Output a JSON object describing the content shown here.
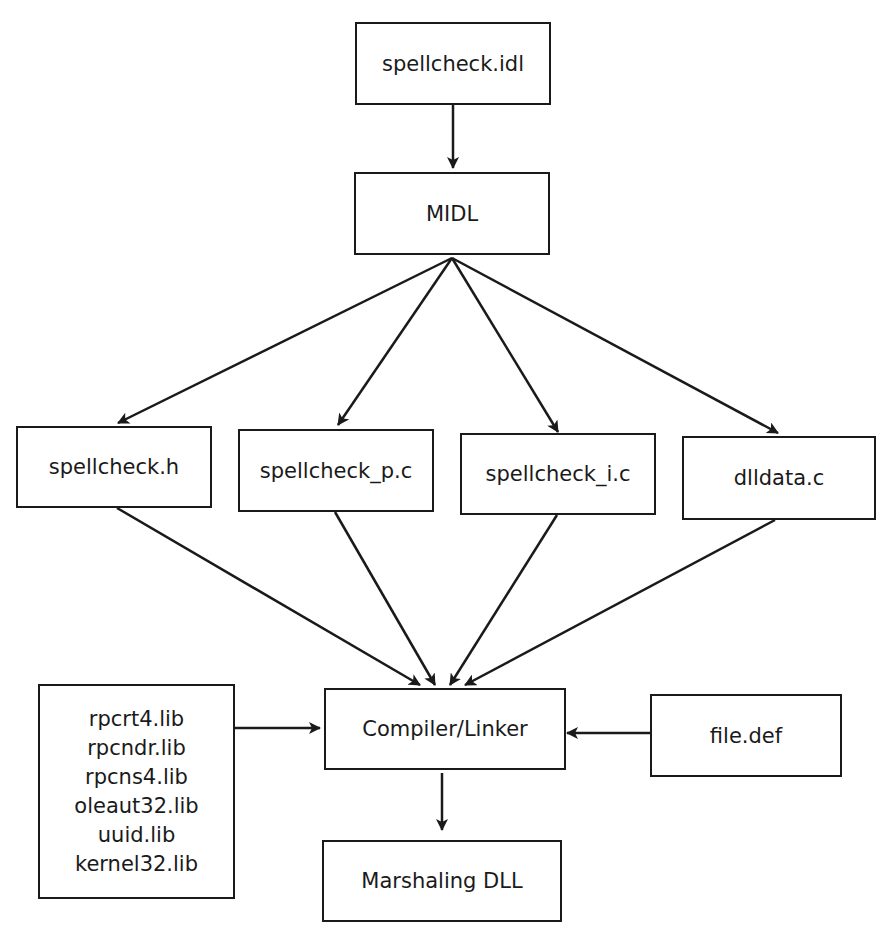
{
  "diagram": {
    "nodes": {
      "idl": "spellcheck.idl",
      "midl": "MIDL",
      "header": "spellcheck.h",
      "proxy": "spellcheck_p.c",
      "iid": "spellcheck_i.c",
      "dlldata": "dlldata.c",
      "compiler": "Compiler/Linker",
      "def": "file.def",
      "output": "Marshaling DLL",
      "libs": [
        "rpcrt4.lib",
        "rpcndr.lib",
        "rpcns4.lib",
        "oleaut32.lib",
        "uuid.lib",
        "kernel32.lib"
      ]
    },
    "edges": [
      {
        "from": "idl",
        "to": "midl"
      },
      {
        "from": "midl",
        "to": "header"
      },
      {
        "from": "midl",
        "to": "proxy"
      },
      {
        "from": "midl",
        "to": "iid"
      },
      {
        "from": "midl",
        "to": "dlldata"
      },
      {
        "from": "header",
        "to": "compiler"
      },
      {
        "from": "proxy",
        "to": "compiler"
      },
      {
        "from": "iid",
        "to": "compiler"
      },
      {
        "from": "dlldata",
        "to": "compiler"
      },
      {
        "from": "libs",
        "to": "compiler"
      },
      {
        "from": "def",
        "to": "compiler"
      },
      {
        "from": "compiler",
        "to": "output"
      }
    ]
  }
}
